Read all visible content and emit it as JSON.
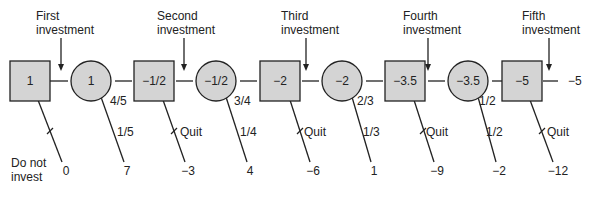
{
  "colors": {
    "node_fill": "#d4d4d4",
    "stroke": "#222222",
    "text": "#222222"
  },
  "nodes": [
    {
      "id": "d1",
      "type": "decision",
      "value": "1"
    },
    {
      "id": "c1",
      "type": "chance",
      "value": "1"
    },
    {
      "id": "d2",
      "type": "decision",
      "value": "−1/2"
    },
    {
      "id": "c2",
      "type": "chance",
      "value": "−1/2"
    },
    {
      "id": "d3",
      "type": "decision",
      "value": "−2"
    },
    {
      "id": "c3",
      "type": "chance",
      "value": "−2"
    },
    {
      "id": "d4",
      "type": "decision",
      "value": "−3.5"
    },
    {
      "id": "c4",
      "type": "chance",
      "value": "−3.5"
    },
    {
      "id": "d5",
      "type": "decision",
      "value": "−5"
    }
  ],
  "investment_labels": [
    {
      "line1": "First",
      "line2": "investment"
    },
    {
      "line1": "Second",
      "line2": "investment"
    },
    {
      "line1": "Third",
      "line2": "investment"
    },
    {
      "line1": "Fourth",
      "line2": "investment"
    },
    {
      "line1": "Fifth",
      "line2": "investment"
    }
  ],
  "continue_probs": [
    "4/5",
    "3/4",
    "2/3",
    "1/2"
  ],
  "branch_probs": [
    "1/5",
    "1/4",
    "1/3",
    "1/2"
  ],
  "quit_label": "Quit",
  "do_not_invest": {
    "line1": "Do not",
    "line2": "invest"
  },
  "payoffs": [
    "0",
    "7",
    "−3",
    "4",
    "−6",
    "1",
    "−9",
    "−2",
    "−12"
  ],
  "final_payoff": "−5"
}
